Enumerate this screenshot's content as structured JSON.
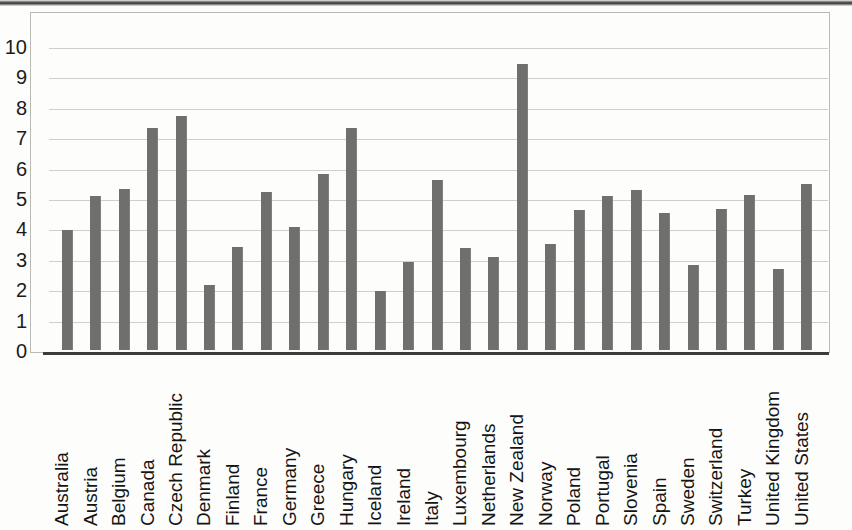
{
  "chart_data": {
    "type": "bar",
    "title": "",
    "subtitle": "",
    "xlabel": "",
    "ylabel": "",
    "ylim": [
      0,
      10
    ],
    "ytick_labels": [
      "10",
      "9",
      "8",
      "7",
      "6",
      "5",
      "4",
      "3",
      "2",
      "1",
      "0"
    ],
    "yticks": [
      10,
      9,
      8,
      7,
      6,
      5,
      4,
      3,
      2,
      1,
      0
    ],
    "grid": true,
    "legend": false,
    "legend_position": "none",
    "bar_color": "#6f6f6d",
    "categories": [
      "Australia",
      "Austria",
      "Belgium",
      "Canada",
      "Czech Republic",
      "Denmark",
      "Finland",
      "France",
      "Germany",
      "Greece",
      "Hungary",
      "Iceland",
      "Ireland",
      "Italy",
      "Luxembourg",
      "Netherlands",
      "New Zealand",
      "Norway",
      "Poland",
      "Portugal",
      "Slovenia",
      "Spain",
      "Sweden",
      "Switzerland",
      "Turkey",
      "United Kingdom",
      "United States"
    ],
    "values": [
      3.95,
      5.05,
      5.3,
      7.3,
      7.7,
      2.15,
      3.4,
      5.2,
      4.05,
      5.8,
      7.3,
      1.95,
      2.9,
      5.6,
      3.35,
      3.05,
      9.4,
      3.5,
      4.6,
      5.05,
      5.25,
      4.5,
      2.8,
      4.65,
      5.1,
      2.65,
      5.45
    ]
  },
  "colors": {
    "bar": "#6f6f6d",
    "gridline": "#cfcfcb",
    "axis": "#3c3c3a",
    "frame": "#b9b9b6",
    "text": "#141414",
    "background": "#fdfdfc"
  }
}
